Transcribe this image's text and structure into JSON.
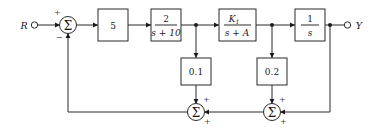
{
  "diagram": {
    "kind": "control-system-block-diagram",
    "input": {
      "label": "R",
      "terminal": "open-circle"
    },
    "output": {
      "label": "Y",
      "terminal": "open-circle"
    },
    "blocks": [
      {
        "id": "gain5",
        "name": "gain-block-5",
        "label": "5",
        "type": "gain"
      },
      {
        "id": "lag10",
        "name": "transfer-block-2-over-s-plus-10",
        "numerator": "2",
        "denominator": "s + 10",
        "type": "transfer-function"
      },
      {
        "id": "k1",
        "name": "transfer-block-k1-over-s-plus-a",
        "numerator": "K",
        "numerator_sub": "1",
        "denominator": "s + A",
        "type": "transfer-function"
      },
      {
        "id": "integrator",
        "name": "transfer-block-1-over-s",
        "numerator": "1",
        "denominator": "s",
        "type": "integrator"
      },
      {
        "id": "fb01",
        "name": "feedback-gain-block-0.1",
        "label": "0.1",
        "type": "gain"
      },
      {
        "id": "fb02",
        "name": "feedback-gain-block-0.2",
        "label": "0.2",
        "type": "gain"
      }
    ],
    "summers": [
      {
        "id": "sum1",
        "name": "summing-junction-input",
        "glyph": "Σ",
        "signs": [
          "+",
          "−"
        ]
      },
      {
        "id": "sum2",
        "name": "summing-junction-inner-feedback",
        "glyph": "Σ",
        "signs": [
          "+",
          "+"
        ]
      },
      {
        "id": "sum3",
        "name": "summing-junction-outer-feedback",
        "glyph": "Σ",
        "signs": [
          "+",
          "+"
        ]
      }
    ],
    "colors": {
      "wire": "#2b2b2b",
      "text": "#1a1a1a",
      "background": "#ffffff"
    }
  }
}
